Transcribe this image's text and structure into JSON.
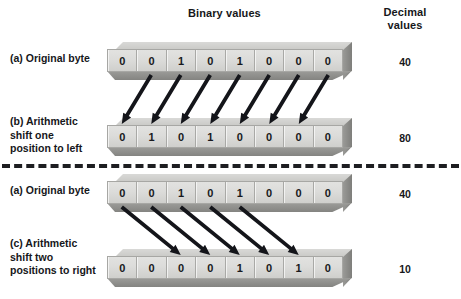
{
  "figure": {
    "headers": {
      "binary": "Binary values",
      "decimal": "Decimal\nvalues"
    },
    "divider": {
      "style": "dashed",
      "color": "#1d1e21"
    }
  },
  "rows": [
    {
      "id": "row-a-top",
      "label": "(a) Original byte",
      "bits": [
        "0",
        "0",
        "1",
        "0",
        "1",
        "0",
        "0",
        "0"
      ],
      "decimal": "40"
    },
    {
      "id": "row-b",
      "label": "(b) Arithmetic\nshift one\nposition to left",
      "bits": [
        "0",
        "1",
        "0",
        "1",
        "0",
        "0",
        "0",
        "0"
      ],
      "decimal": "80"
    },
    {
      "id": "row-a-bottom",
      "label": "(a) Original byte",
      "bits": [
        "0",
        "0",
        "1",
        "0",
        "1",
        "0",
        "0",
        "0"
      ],
      "decimal": "40"
    },
    {
      "id": "row-c",
      "label": "(c) Arithmetic\nshift two\npositions to right",
      "bits": [
        "0",
        "0",
        "0",
        "0",
        "1",
        "0",
        "1",
        "0"
      ],
      "decimal": "10"
    }
  ],
  "arrows": {
    "left_shift": {
      "count": 7,
      "direction": "down-left",
      "from_row": "row-a-top",
      "to_row": "row-b",
      "from_cells": [
        2,
        3,
        4,
        5,
        6,
        7,
        8
      ],
      "to_cells": [
        1,
        2,
        3,
        4,
        5,
        6,
        7
      ],
      "color": "#14151a"
    },
    "right_shift": {
      "count": 5,
      "direction": "down-right",
      "from_row": "row-a-bottom",
      "to_row": "row-c",
      "from_cells": [
        1,
        2,
        3,
        4,
        5
      ],
      "to_cells": [
        3,
        4,
        5,
        6,
        7
      ],
      "color": "#14151a"
    }
  },
  "chart_data": {
    "type": "diagram",
    "title": "Arithmetic shift",
    "xlabel": "",
    "ylabel": "",
    "categories": [
      "(a) Original byte",
      "(b) Arithmetic shift one position to left",
      "(a) Original byte",
      "(c) Arithmetic shift two positions to right"
    ],
    "series": [
      {
        "name": "binary",
        "values": [
          "00101000",
          "01010000",
          "00101000",
          "00001010"
        ]
      },
      {
        "name": "decimal",
        "values": [
          40,
          80,
          40,
          10
        ]
      }
    ]
  }
}
